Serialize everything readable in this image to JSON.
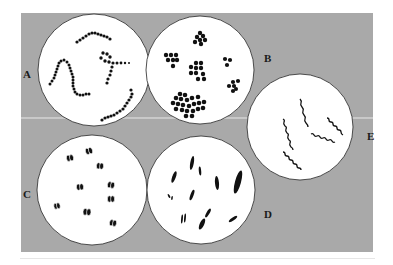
{
  "figure": {
    "background_color": "#a9a9a9",
    "panel_line_color": "#e8e8e8",
    "circle_fill": "#ffffff",
    "cell_color": "#111111",
    "panels": [
      {
        "id": "A",
        "label": "A",
        "description": "cocci in chains (streptococci)"
      },
      {
        "id": "B",
        "label": "B",
        "description": "cocci in clusters (staphylococci / tetrads / sarcinae)"
      },
      {
        "id": "C",
        "label": "C",
        "description": "diplococci (paired cocci)"
      },
      {
        "id": "D",
        "label": "D",
        "description": "rods (bacilli)"
      },
      {
        "id": "E",
        "label": "E",
        "description": "spirals (spirilla)"
      }
    ]
  }
}
